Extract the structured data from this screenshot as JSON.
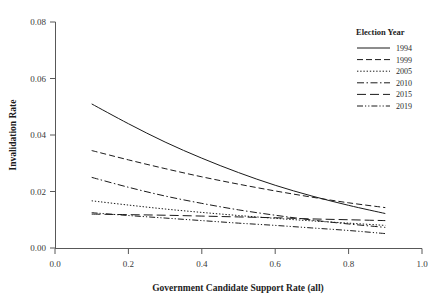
{
  "chart_data": {
    "type": "line",
    "title": "",
    "xlabel": "Government Candidate Support Rate (all)",
    "ylabel": "Invalidation Rate",
    "xlim": [
      0.0,
      1.0
    ],
    "ylim": [
      0.0,
      0.08
    ],
    "xticks": [
      "0.0",
      "0.2",
      "0.4",
      "0.6",
      "0.8",
      "1.0"
    ],
    "xtick_values": [
      0.0,
      0.2,
      0.4,
      0.6,
      0.8,
      1.0
    ],
    "yticks": [
      "0.00",
      "0.02",
      "0.04",
      "0.06",
      "0.08"
    ],
    "ytick_values": [
      0.0,
      0.02,
      0.04,
      0.06,
      0.08
    ],
    "grid": false,
    "legend_title": "Election Year",
    "legend_position": "top-right",
    "x": [
      0.1,
      0.2,
      0.3,
      0.4,
      0.5,
      0.6,
      0.7,
      0.8,
      0.9
    ],
    "series": [
      {
        "name": "1994",
        "label": "1994",
        "linestyle": "solid",
        "dasharray": "none",
        "values": [
          0.051,
          0.044,
          0.0375,
          0.0318,
          0.0267,
          0.0222,
          0.0184,
          0.0151,
          0.0122
        ]
      },
      {
        "name": "1999",
        "label": "1999",
        "linestyle": "dashed",
        "dasharray": "6,3",
        "values": [
          0.0345,
          0.0312,
          0.0281,
          0.0252,
          0.0226,
          0.0202,
          0.018,
          0.016,
          0.0143
        ]
      },
      {
        "name": "2005",
        "label": "2005",
        "linestyle": "dotted",
        "dasharray": "1.4,1.8",
        "values": [
          0.0167,
          0.0152,
          0.0138,
          0.0126,
          0.0115,
          0.0105,
          0.0096,
          0.0088,
          0.008
        ]
      },
      {
        "name": "2010",
        "label": "2010",
        "linestyle": "dash-dot",
        "dasharray": "7,2.5,1.5,2.5",
        "values": [
          0.025,
          0.0215,
          0.0184,
          0.0158,
          0.0135,
          0.0116,
          0.0099,
          0.0085,
          0.0073
        ]
      },
      {
        "name": "2015",
        "label": "2015",
        "linestyle": "long-dash",
        "dasharray": "9,4",
        "values": [
          0.012,
          0.0118,
          0.0116,
          0.0113,
          0.011,
          0.0107,
          0.0103,
          0.01,
          0.0097
        ]
      },
      {
        "name": "2019",
        "label": "2019",
        "linestyle": "dash-dot-dot",
        "dasharray": "6,2,1.2,2,1.2,2",
        "values": [
          0.0125,
          0.0115,
          0.0106,
          0.0097,
          0.0088,
          0.008,
          0.0071,
          0.0062,
          0.0051
        ]
      }
    ]
  },
  "colors": {
    "background": "#ffffff",
    "line": "#1a1a1a",
    "axis": "#585858",
    "text": "#1d1d1d"
  }
}
